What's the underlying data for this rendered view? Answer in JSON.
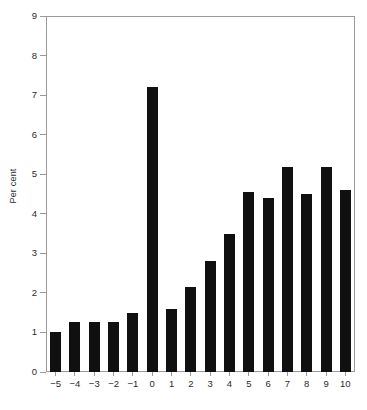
{
  "chart_data": {
    "type": "bar",
    "title": "",
    "subtitle": "",
    "xlabel": "",
    "ylabel": "Per cent",
    "categories": [
      "−5",
      "−4",
      "−3",
      "−2",
      "−1",
      "0",
      "1",
      "2",
      "3",
      "4",
      "5",
      "6",
      "7",
      "8",
      "9",
      "10"
    ],
    "values": [
      1.0,
      1.27,
      1.27,
      1.27,
      1.5,
      7.2,
      1.6,
      2.15,
      2.8,
      3.48,
      4.55,
      4.4,
      5.18,
      4.5,
      5.18,
      4.6
    ],
    "ylim": [
      0,
      9
    ],
    "ytick_labels": [
      "0",
      "1",
      "2",
      "3",
      "4",
      "5",
      "6",
      "7",
      "8",
      "9"
    ],
    "ytick_values": [
      0,
      1,
      2,
      3,
      4,
      5,
      6,
      7,
      8,
      9
    ],
    "grid": false,
    "legend": false,
    "legend_position": "none",
    "bar_color": "#101010",
    "axis_color": "#9a9a9a",
    "text_color": "#2b2b2b",
    "annotations": []
  }
}
